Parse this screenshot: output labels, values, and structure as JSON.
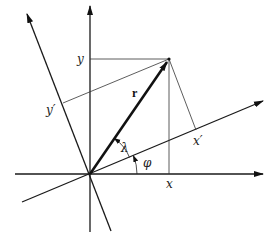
{
  "diagram": {
    "labels": {
      "x": "x",
      "y": "y",
      "x_prime": "x′",
      "y_prime": "y′",
      "vector": "r",
      "angle_lambda": "λ",
      "angle_phi": "φ"
    },
    "colors": {
      "stroke": "#1a1a1a",
      "background": "#ffffff"
    },
    "geometry": {
      "origin": [
        90,
        174
      ],
      "vector_tip": [
        169,
        59
      ],
      "x_axis_end": [
        263,
        174
      ],
      "y_axis_end": [
        90,
        6
      ],
      "x_prime_axis_end": [
        263,
        101
      ],
      "y_prime_axis_end": [
        27,
        14
      ]
    }
  }
}
